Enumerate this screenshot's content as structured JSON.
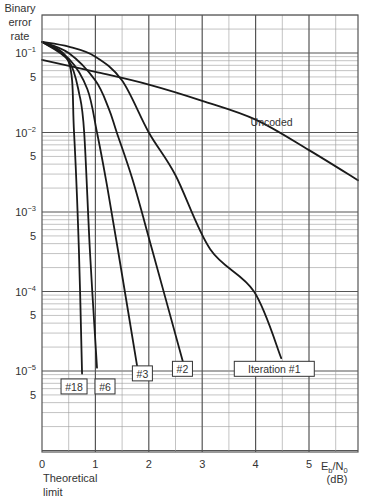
{
  "chart_data": {
    "type": "line",
    "title": "",
    "ylabel": "Binary error rate",
    "ylabel_lines": [
      "Binary",
      "error",
      "rate"
    ],
    "xlabel": "Eb/N0 (dB)",
    "xlabel_main": "E",
    "xlabel_sub_b": "b",
    "xlabel_slash": "/N",
    "xlabel_sub_0": "0",
    "xlabel_unit": "(dB)",
    "x_scale": "linear",
    "y_scale": "log",
    "xlim": [
      0,
      5.92
    ],
    "ylim": [
      1e-06,
      0.3
    ],
    "grid": true,
    "x_ticks": [
      {
        "value": 0,
        "label": "0"
      },
      {
        "value": 1,
        "label": "1"
      },
      {
        "value": 2,
        "label": "2"
      },
      {
        "value": 3,
        "label": "3"
      },
      {
        "value": 4,
        "label": "4"
      },
      {
        "value": 5,
        "label": "5"
      }
    ],
    "y_ticks": [
      {
        "value": 0.1,
        "base": "10",
        "exp": "−1"
      },
      {
        "value": 0.05,
        "label": "5"
      },
      {
        "value": 0.01,
        "base": "10",
        "exp": "−2"
      },
      {
        "value": 0.005,
        "label": "5"
      },
      {
        "value": 0.001,
        "base": "10",
        "exp": "−3"
      },
      {
        "value": 0.0005,
        "label": "5"
      },
      {
        "value": 0.0001,
        "base": "10",
        "exp": "−4"
      },
      {
        "value": 5e-05,
        "label": "5"
      },
      {
        "value": 1e-05,
        "base": "10",
        "exp": "−5"
      },
      {
        "value": 5e-06,
        "label": "5"
      }
    ],
    "annotations": [
      {
        "text": "Theoretical",
        "x": 0,
        "position": "below-axis"
      },
      {
        "text": "limit",
        "x": 0,
        "position": "below-axis"
      }
    ],
    "series": [
      {
        "name": "Uncoded",
        "label_pos": {
          "x": 4.3,
          "y": 0.0135
        },
        "boxed": false,
        "x": [
          0,
          1,
          2,
          3,
          4,
          5,
          5.92
        ],
        "y": [
          0.082,
          0.058,
          0.04,
          0.025,
          0.0145,
          0.006,
          0.0025
        ]
      },
      {
        "name": "Iteration #1",
        "label_pos": {
          "x": 4.35,
          "y": 1.05e-05
        },
        "boxed": true,
        "x": [
          0,
          0.5,
          1.0,
          1.5,
          2.0,
          2.5,
          3.15,
          3.97,
          4.48
        ],
        "y": [
          0.138,
          0.12,
          0.09,
          0.045,
          0.01,
          0.0029,
          0.00034,
          0.0001,
          1.45e-05
        ]
      },
      {
        "name": "#2",
        "label_pos": {
          "x": 2.63,
          "y": 1.05e-05
        },
        "boxed": true,
        "x": [
          0,
          0.5,
          1.0,
          1.25,
          1.4,
          1.7,
          2.06,
          2.64
        ],
        "y": [
          0.138,
          0.1,
          0.045,
          0.02,
          0.01,
          0.0025,
          0.00034,
          1.3e-05
        ]
      },
      {
        "name": "#3",
        "label_pos": {
          "x": 1.88,
          "y": 9.2e-06
        },
        "boxed": true,
        "x": [
          0,
          0.5,
          0.85,
          1.03,
          1.2,
          1.42,
          1.8
        ],
        "y": [
          0.138,
          0.085,
          0.035,
          0.01,
          0.0025,
          0.00034,
          9.7e-06
        ]
      },
      {
        "name": "#6",
        "label_pos": {
          "x": 1.18,
          "y": 6.3e-06
        },
        "boxed": true,
        "x": [
          0,
          0.5,
          0.7,
          0.79,
          0.9,
          1.03
        ],
        "y": [
          0.138,
          0.08,
          0.03,
          0.01,
          0.0003,
          1.1e-05
        ]
      },
      {
        "name": "#18",
        "label_pos": {
          "x": 0.6,
          "y": 6.3e-06
        },
        "boxed": true,
        "x": [
          0,
          0.5,
          0.6,
          0.69,
          0.75
        ],
        "y": [
          0.138,
          0.077,
          0.01,
          0.00035,
          9.3e-06
        ]
      }
    ]
  }
}
